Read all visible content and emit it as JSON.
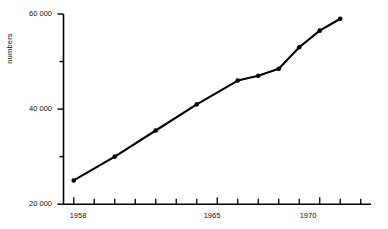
{
  "chart_data": {
    "type": "line",
    "title": "",
    "xlabel": "",
    "ylabel": "numbers",
    "x": [
      1958,
      1960,
      1962,
      1964,
      1966,
      1967,
      1968,
      1969,
      1970,
      1971
    ],
    "values": [
      25000,
      30000,
      35500,
      41000,
      46000,
      47000,
      48500,
      53000,
      56500,
      59000
    ],
    "series": [
      {
        "name": "numbers",
        "values": [
          25000,
          30000,
          35500,
          41000,
          46000,
          47000,
          48500,
          53000,
          56500,
          59000
        ]
      }
    ],
    "ylim": [
      20000,
      60000
    ],
    "xlim": [
      1957.5,
      1972.5
    ],
    "y_major_ticks": [
      20000,
      40000,
      60000
    ],
    "y_major_tick_labels": [
      "20 000",
      "40 000",
      "60 000"
    ],
    "y_minor_ticks": [
      30000,
      50000
    ],
    "x_ticks": [
      1958,
      1959,
      1960,
      1961,
      1962,
      1963,
      1964,
      1965,
      1966,
      1967,
      1968,
      1969,
      1970,
      1971,
      1972
    ],
    "x_tick_labels": [
      "1958",
      "",
      "",
      "",
      "",
      "",
      "",
      "1965",
      "",
      "",
      "",
      "",
      "1970",
      "",
      ""
    ],
    "x_labeled_ticks": [
      {
        "year": 1958,
        "label": "1958"
      },
      {
        "year": 1965,
        "label": "1965"
      },
      {
        "year": 1970,
        "label": "1970"
      }
    ],
    "grid": false,
    "legend": "none",
    "marker": "filled-circle",
    "line_color": "#000000",
    "marker_color": "#000000",
    "axis_color": "#000000"
  },
  "axes": {
    "y_title": "numbers"
  }
}
